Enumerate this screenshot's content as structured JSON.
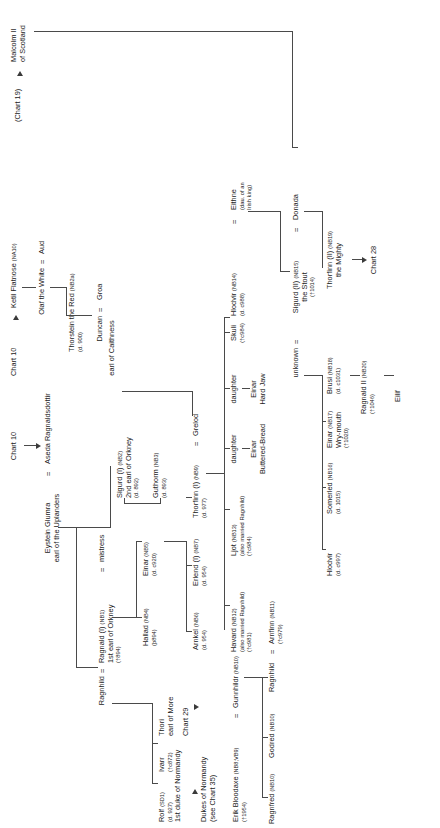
{
  "chart": {
    "title": "Chart 10",
    "orientation": "rotated-90",
    "source_ref": "Chart 10",
    "line_color": "#4a4a4a"
  },
  "refs": {
    "top_chart": "Chart 10",
    "chart19": "(Chart 19)",
    "chart28": "Chart 28",
    "chart29": "Chart 29",
    "chart35": "(see Chart 35)",
    "dukes_of_normandy": "Dukes of Normandy"
  },
  "people": {
    "eystein": {
      "name": "Eystein Glumra",
      "title": "earl of the Uplanders"
    },
    "aseda": {
      "name": "Aseda Ragnaldsdottir"
    },
    "ragnhild_1": {
      "name": "Ragnhild"
    },
    "ragnald_1": {
      "name": "Ragnald (I)",
      "code": "(NB1)",
      "title": "1st earl of Orkney",
      "dates": "(†894)"
    },
    "mistress": {
      "name": "mistress"
    },
    "sigurd_1": {
      "name": "Sigurd (I)",
      "code": "(NB2)",
      "title": "2nd earl of Orkney",
      "dates": "(d. 892)"
    },
    "guthorm": {
      "name": "Guthorm",
      "code": "(NB3)",
      "dates": "(d. 893)"
    },
    "hallad": {
      "name": "Hallad",
      "code": "(NB4)",
      "dates": "(þ894)"
    },
    "einar_nb5": {
      "name": "Einar",
      "code": "(NB5)",
      "dates": "(d. c920)"
    },
    "thori": {
      "name": "Thori",
      "title": "earl of More"
    },
    "ivarr": {
      "name": "Ivarr",
      "dates": "(†c872)"
    },
    "rolf": {
      "name": "Rolf",
      "code": "(SD1)",
      "dates": "(d. 927)",
      "title": "1st duke of Normandy"
    },
    "erik_bloodaxe": {
      "name": "Erik Bloodaxe",
      "code": "(NB8;VB9)",
      "dates": "(†1954)"
    },
    "gunnhildr": {
      "name": "Gunnhildr",
      "code": "(NB10)"
    },
    "ragnfred": {
      "name": "Ragnfred",
      "code": "(NB10)"
    },
    "godred": {
      "name": "Godred",
      "code": "(NB10)"
    },
    "ragnhild_2": {
      "name": "Ragnhild"
    },
    "arnfinn": {
      "name": "Arnfinn",
      "code": "(NB11)",
      "dates": "(†c979)"
    },
    "havard": {
      "name": "Havard",
      "code": "(NB12)",
      "note": "(also married Ragnhild)",
      "dates": "(†c981)"
    },
    "ljot": {
      "name": "Ljot",
      "code": "(NB13)",
      "note": "(also married Ragnhild)",
      "dates": "(†c984)"
    },
    "arnkel": {
      "name": "Arnkel",
      "code": "(NB6)",
      "dates": "(d. 954)"
    },
    "erlend_1": {
      "name": "Erlend (I)",
      "code": "(NB7)",
      "dates": "(d. 954)"
    },
    "thorfinn_1": {
      "name": "Thorfinn (I)",
      "code": "(NB9)",
      "dates": "(d. 977)"
    },
    "grelod": {
      "name": "Grelod"
    },
    "ketil": {
      "name": "Ketil Flatnose",
      "code": "(NA10)"
    },
    "olaf_the_white": {
      "name": "Olaf the White"
    },
    "aud": {
      "name": "Aud"
    },
    "thorstein_the_red": {
      "name": "Thorstein the Red",
      "code": "(NB2a)",
      "dates": "(d. 900)"
    },
    "duncan": {
      "name": "Duncan",
      "title": "earl of Caithness"
    },
    "groa": {
      "name": "Groa"
    },
    "daughter_1": {
      "name": "daughter"
    },
    "einar_buttered": {
      "name": "Einar",
      "title": "Buttered-Bread"
    },
    "daughter_2": {
      "name": "daughter"
    },
    "einar_hardjaw": {
      "name": "Einar",
      "title": "Hard Jaw"
    },
    "skuli": {
      "name": "Skuli",
      "dates": "(†c984)"
    },
    "hlodvir_nb14": {
      "name": "Hlodvir",
      "code": "(NB14)",
      "dates": "(d. c988)"
    },
    "eithne": {
      "name": "Eithne",
      "note1": "(dau. of an",
      "note2": "Irish king)"
    },
    "malcolm_ii": {
      "name": "Malcolm II",
      "title": "of Scotland"
    },
    "sigurd_2": {
      "name": "Sigurd (II)",
      "code": "(NB15)",
      "title": "the Stout",
      "dates": "(†1014)"
    },
    "donada": {
      "name": "Donada"
    },
    "unknown": {
      "name": "unknown"
    },
    "thorfinn_2": {
      "name": "Thorfinn (II)",
      "code": "(NB19)",
      "title": "the Mighty"
    },
    "hlodvir_c997": {
      "name": "Hlodvir",
      "dates": "(d. c997)"
    },
    "somerled": {
      "name": "Somerled",
      "code": "(NB16)",
      "dates": "(d. 1015)"
    },
    "einar_wry": {
      "name": "Einar",
      "code": "(NB17)",
      "title": "Wry-mouth",
      "dates": "(†1020)"
    },
    "brusi": {
      "name": "Brusi",
      "code": "(NB18)",
      "dates": "(d. c1031)"
    },
    "ragnald_2": {
      "name": "Ragnald II",
      "code": "(NB20)",
      "dates": "(†1046)"
    },
    "eilif": {
      "name": "Eilif"
    }
  },
  "symbols": {
    "marriage": "="
  }
}
